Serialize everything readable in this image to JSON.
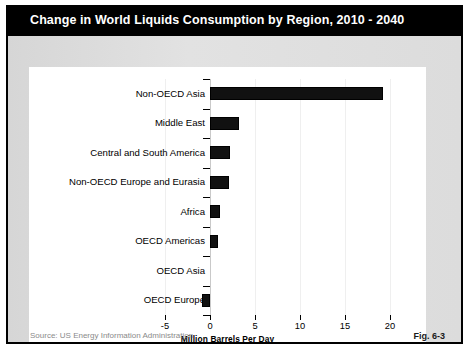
{
  "figure": {
    "title": "Change in World Liquids Consumption by Region, 2010 - 2040",
    "source": "Source:  US Energy Information Administration",
    "fig_number": "Fig. 6-3",
    "title_band_color": "#000000",
    "title_text_color": "#ffffff",
    "bar_color": "#111111",
    "card_color": "#ffffff",
    "body_color": "#dcdcdc"
  },
  "chart_data": {
    "type": "bar",
    "orientation": "horizontal",
    "title": "Change in World Liquids Consumption by Region, 2010 - 2040",
    "xlabel": "Million Barrels Per Day",
    "ylabel": "",
    "xlim": [
      -5,
      22.5
    ],
    "xticks": [
      -5,
      0,
      5,
      10,
      15,
      20
    ],
    "xticklabels": [
      "-5",
      "0",
      "5",
      "10",
      "15",
      "20"
    ],
    "grid": true,
    "grid_axis": "x",
    "legend": false,
    "categories": [
      "Non-OECD Asia",
      "Middle East",
      "Central and South America",
      "Non-OECD Europe and Eurasia",
      "Africa",
      "OECD Americas",
      "OECD Asia",
      "OECD Europe"
    ],
    "values": [
      19.2,
      3.2,
      2.2,
      2.1,
      1.1,
      0.9,
      0.0,
      -0.9
    ],
    "series": [
      {
        "name": "Change in liquids consumption",
        "values": [
          19.2,
          3.2,
          2.2,
          2.1,
          1.1,
          0.9,
          0.0,
          -0.9
        ]
      }
    ]
  }
}
